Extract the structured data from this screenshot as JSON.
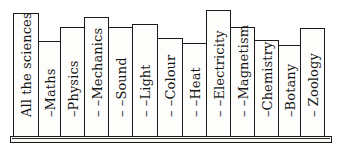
{
  "figure": {
    "shelf": {
      "left": 10,
      "right": 332,
      "top": 136,
      "bottom": 143
    },
    "books_bottom": 136,
    "books": [
      {
        "label": "All the sciences",
        "left": 13,
        "right": 38,
        "top": 13
      },
      {
        "label": "–Maths",
        "left": 38,
        "right": 60,
        "top": 41
      },
      {
        "label": "–Physics",
        "left": 60,
        "right": 84,
        "top": 27
      },
      {
        "label": "– –Mechanics",
        "left": 84,
        "right": 108,
        "top": 17
      },
      {
        "label": "– –Sound",
        "left": 108,
        "right": 132,
        "top": 27
      },
      {
        "label": "– –Light",
        "left": 132,
        "right": 157,
        "top": 24
      },
      {
        "label": "– –Colour",
        "left": 157,
        "right": 182,
        "top": 38
      },
      {
        "label": "– –Heat",
        "left": 182,
        "right": 206,
        "top": 43
      },
      {
        "label": "– –Electricity",
        "left": 206,
        "right": 230,
        "top": 10
      },
      {
        "label": "– –Magnetism",
        "left": 230,
        "right": 254,
        "top": 27
      },
      {
        "label": "–Chemistry",
        "left": 254,
        "right": 278,
        "top": 40
      },
      {
        "label": "–Botany",
        "left": 278,
        "right": 300,
        "top": 45
      },
      {
        "label": "– Zoology",
        "left": 300,
        "right": 324,
        "top": 28
      }
    ]
  }
}
